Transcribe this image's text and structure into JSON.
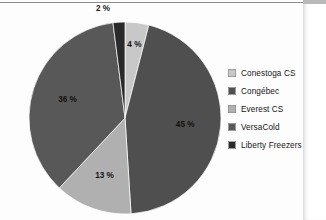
{
  "page": {
    "background_color": "#fdfdfd",
    "top_rule_color": "#8c8c8c",
    "clipped_left_text": "ers"
  },
  "chart_data": {
    "type": "pie",
    "title": "",
    "subtitle": "",
    "xlabel": "",
    "ylabel": "",
    "grid": false,
    "legend_position": "right",
    "categories": [
      "Conestoga CS",
      "Congébec",
      "Everest CS",
      "VersaCold",
      "Liberty Freezers"
    ],
    "values": [
      4,
      45,
      13,
      36,
      2
    ],
    "value_labels": [
      "4 %",
      "45 %",
      "13 %",
      "36 %",
      "2 %"
    ],
    "colors": [
      "#c8c8c8",
      "#4f4f4f",
      "#b0b0b0",
      "#585858",
      "#2a2a2a"
    ],
    "slices": [
      {
        "name": "Conestoga CS",
        "value": 4,
        "label": "4 %",
        "color": "#c8c8c8",
        "label_placement": "inside"
      },
      {
        "name": "Congébec",
        "value": 45,
        "label": "45 %",
        "color": "#4f4f4f",
        "label_placement": "inside"
      },
      {
        "name": "Everest CS",
        "value": 13,
        "label": "13 %",
        "color": "#b0b0b0",
        "label_placement": "inside"
      },
      {
        "name": "VersaCold",
        "value": 36,
        "label": "36 %",
        "color": "#585858",
        "label_placement": "inside"
      },
      {
        "name": "Liberty Freezers",
        "value": 2,
        "label": "2 %",
        "color": "#2a2a2a",
        "label_placement": "outside"
      }
    ],
    "start_angle_deg": 0,
    "direction": "clockwise",
    "total": 100,
    "units": "%"
  },
  "legend": {
    "items": [
      {
        "label": "Conestoga CS",
        "color": "#c8c8c8"
      },
      {
        "label": "Congébec",
        "color": "#4f4f4f"
      },
      {
        "label": "Everest CS",
        "color": "#b0b0b0"
      },
      {
        "label": "VersaCold",
        "color": "#585858"
      },
      {
        "label": "Liberty Freezers",
        "color": "#2a2a2a"
      }
    ]
  },
  "labels": {
    "outside_2pct": "2 %"
  }
}
